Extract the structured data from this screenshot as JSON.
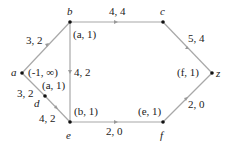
{
  "nodes": [
    {
      "id": "a",
      "label": "a",
      "x": 22,
      "y": 73,
      "mark": "(-1, ∞)"
    },
    {
      "id": "b",
      "label": "b",
      "x": 70,
      "y": 22,
      "mark": "(a, 1)"
    },
    {
      "id": "c",
      "label": "c",
      "x": 163,
      "y": 22,
      "mark": ""
    },
    {
      "id": "d",
      "label": "d",
      "x": 45,
      "y": 96,
      "mark": "(a, 1)"
    },
    {
      "id": "e",
      "label": "e",
      "x": 70,
      "y": 122,
      "mark": "(b, 1)"
    },
    {
      "id": "f",
      "label": "f",
      "x": 163,
      "y": 122,
      "mark": "(e, 1)"
    },
    {
      "id": "z",
      "label": "z",
      "x": 212,
      "y": 73,
      "mark": "(f, 1)"
    }
  ],
  "edges": [
    {
      "from": "a",
      "to": "b",
      "label": "3, 2"
    },
    {
      "from": "b",
      "to": "c",
      "label": "4, 4"
    },
    {
      "from": "c",
      "to": "z",
      "label": "5, 4"
    },
    {
      "from": "b",
      "to": "e",
      "label": "4, 2"
    },
    {
      "from": "a",
      "to": "d",
      "label": "3, 2"
    },
    {
      "from": "d",
      "to": "e",
      "label": "4, 2"
    },
    {
      "from": "e",
      "to": "f",
      "label": "2, 0"
    },
    {
      "from": "f",
      "to": "z",
      "label": "2, 0"
    }
  ],
  "colors": {
    "edge": "#a8a8a8",
    "node": "#111111",
    "text": "#222222"
  }
}
